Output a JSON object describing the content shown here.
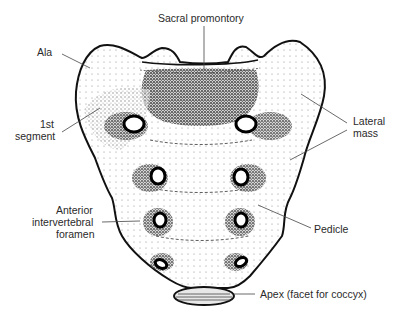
{
  "figure": {
    "labels": {
      "sacral_promontory": "Sacral promontory",
      "ala": "Ala",
      "first_segment_line1": "1st",
      "first_segment_line2": "segment",
      "lateral_mass_line1": "Lateral",
      "lateral_mass_line2": "mass",
      "anterior_foramen_line1": "Anterior",
      "anterior_foramen_line2": "intervertebral",
      "anterior_foramen_line3": "foramen",
      "pedicle": "Pedicle",
      "apex": "Apex (facet for coccyx)"
    },
    "caption_cropped": true
  }
}
